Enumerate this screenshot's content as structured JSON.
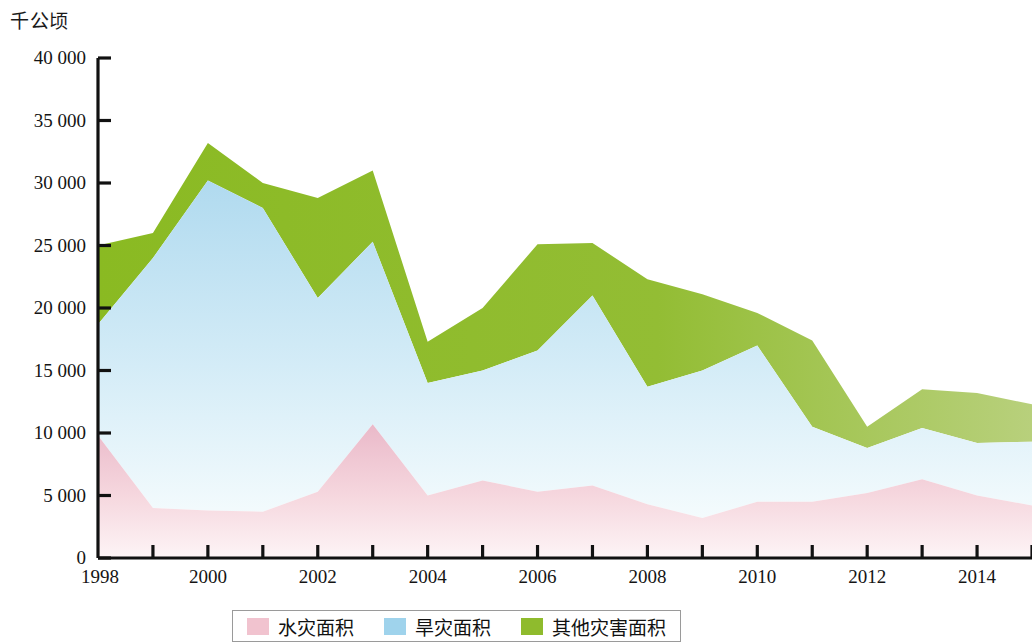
{
  "chart_data": {
    "type": "area",
    "stacked": true,
    "title": "",
    "subtitle": "",
    "unit_label": "千公顷",
    "xlabel": "",
    "ylabel": "",
    "grid": false,
    "legend_position": "bottom",
    "xlim": [
      1998,
      2015
    ],
    "ylim": [
      0,
      40000
    ],
    "ytick_step": 5000,
    "x": [
      1998,
      1999,
      2000,
      2001,
      2002,
      2003,
      2004,
      2005,
      2006,
      2007,
      2008,
      2009,
      2010,
      2011,
      2012,
      2013,
      2014,
      2015
    ],
    "categories": [
      "1998",
      "1999",
      "2000",
      "2001",
      "2002",
      "2003",
      "2004",
      "2005",
      "2006",
      "2007",
      "2008",
      "2009",
      "2010",
      "2011",
      "2012",
      "2013",
      "2014",
      "2015"
    ],
    "xtick_labels": [
      "1998",
      "",
      "2000",
      "",
      "2002",
      "",
      "2004",
      "",
      "2006",
      "",
      "2008",
      "",
      "2010",
      "",
      "2012",
      "",
      "2014",
      ""
    ],
    "ytick_labels": [
      "0",
      "5 000",
      "10 000",
      "15 000",
      "20 000",
      "25 000",
      "30 000",
      "35 000",
      "40 000"
    ],
    "ytick_values": [
      0,
      5000,
      10000,
      15000,
      20000,
      25000,
      30000,
      35000,
      40000
    ],
    "series": [
      {
        "name": "水灾面积",
        "color": "#f1c3cf",
        "values": [
          9800,
          4000,
          3800,
          3700,
          5300,
          10700,
          5000,
          6200,
          5300,
          5800,
          4300,
          3200,
          4500,
          4500,
          5200,
          6300,
          5000,
          4200
        ]
      },
      {
        "name": "旱灾面积",
        "color": "#b8dff2",
        "values": [
          8900,
          20000,
          26400,
          24300,
          15500,
          14600,
          9000,
          8800,
          11300,
          15200,
          9400,
          11800,
          12500,
          6000,
          3600,
          4100,
          4200,
          5100
        ]
      },
      {
        "name": "其他灾害面积",
        "color": "#8fbb2d",
        "values": [
          6300,
          2000,
          3000,
          2000,
          8000,
          5700,
          3300,
          5000,
          8500,
          4200,
          8600,
          6100,
          2600,
          6900,
          1700,
          3100,
          4000,
          3000
        ]
      }
    ],
    "cumulative_tops": {
      "flood": [
        9800,
        4000,
        3800,
        3700,
        5300,
        10700,
        5000,
        6200,
        5300,
        5800,
        4300,
        3200,
        4500,
        4500,
        5200,
        6300,
        5000,
        4200
      ],
      "flood_plus_drought": [
        18700,
        24000,
        30200,
        28000,
        20800,
        25300,
        14000,
        15000,
        16600,
        21000,
        13700,
        15000,
        17000,
        10500,
        8800,
        10400,
        9200,
        9300
      ],
      "total": [
        25000,
        26000,
        33200,
        30000,
        28800,
        31000,
        17300,
        20000,
        25100,
        25200,
        22300,
        21100,
        19600,
        17400,
        10500,
        13500,
        13200,
        12300
      ]
    }
  },
  "legend": {
    "items": [
      {
        "label": "水灾面积",
        "color": "#f1c3cf"
      },
      {
        "label": "旱灾面积",
        "color": "#9fd3ec"
      },
      {
        "label": "其他灾害面积",
        "color": "#8fbb2d"
      }
    ]
  },
  "axis": {
    "unit_caption": "千公顷"
  },
  "colors": {
    "flood_fill_top": "#eebccb",
    "flood_fill_bottom": "#fbf0f3",
    "drought_fill_top": "#b4dcf0",
    "drought_fill_bottom": "#f1fafd",
    "other_fill_left": "#8cba27",
    "other_fill_right": "#b4ce73",
    "axis_line": "#111111",
    "text": "#111111"
  }
}
